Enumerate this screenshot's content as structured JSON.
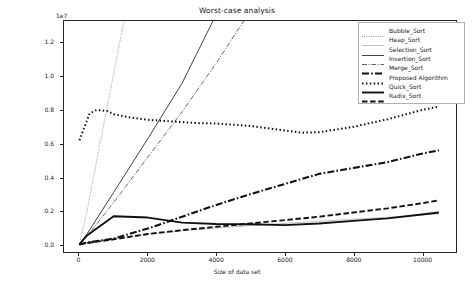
{
  "chart_data": {
    "type": "line",
    "title": "Worst-case analysis",
    "xlabel": "Size of data set",
    "ylabel": "Execution time in nano seconds",
    "y_exponent_label": "1e7",
    "y_scale": 10000000,
    "xlim": [
      -450,
      11000
    ],
    "ylim": [
      -0.045,
      1.33
    ],
    "xticks": [
      0,
      2000,
      4000,
      6000,
      8000,
      10000
    ],
    "xticklabels": [
      "0",
      "2000",
      "4000",
      "6000",
      "8000",
      "10000"
    ],
    "yticks": [
      0.0,
      0.2,
      0.4,
      0.6,
      0.8,
      1.0,
      1.2
    ],
    "yticklabels": [
      "0.0",
      "0.2",
      "0.4",
      "0.6",
      "0.8",
      "1.0",
      "1.2"
    ],
    "grid": false,
    "legend_position": "upper right",
    "series": [
      {
        "name": "Bubble_Sort",
        "style": "dotted-fine",
        "x": [
          0,
          200,
          1300
        ],
        "y": [
          0.0,
          0.18,
          1.33
        ]
      },
      {
        "name": "Heap_Sort",
        "style": "solid-faint",
        "x": [
          0,
          200,
          1000,
          2000,
          3000,
          4000,
          5000,
          6000,
          7000,
          8000,
          9000,
          10000,
          10500
        ],
        "y": [
          0.0,
          0.012,
          0.035,
          0.062,
          0.082,
          0.098,
          0.112,
          0.125,
          0.138,
          0.15,
          0.162,
          0.176,
          0.182
        ]
      },
      {
        "name": "Selection_Sort",
        "style": "solid-thin",
        "x": [
          0,
          200,
          1000,
          2000,
          3000,
          3900
        ],
        "y": [
          0.0,
          0.055,
          0.31,
          0.63,
          0.96,
          1.33
        ]
      },
      {
        "name": "Insertion_Sort",
        "style": "dashdot-thin",
        "x": [
          0,
          200,
          1000,
          2000,
          3000,
          4000,
          4800
        ],
        "y": [
          0.0,
          0.042,
          0.25,
          0.52,
          0.79,
          1.08,
          1.33
        ]
      },
      {
        "name": "Merge_Sort",
        "style": "dashdot-thick",
        "x": [
          0,
          200,
          1000,
          2000,
          3000,
          4000,
          5000,
          6000,
          7000,
          8000,
          9000,
          10000,
          10500
        ],
        "y": [
          0.0,
          0.01,
          0.035,
          0.095,
          0.165,
          0.235,
          0.3,
          0.36,
          0.42,
          0.455,
          0.49,
          0.54,
          0.56
        ]
      },
      {
        "name": "Proposed Algorithm",
        "style": "dotted-thick",
        "x": [
          0,
          150,
          300,
          500,
          800,
          1000,
          1500,
          2000,
          2500,
          3000,
          3500,
          4000,
          5000,
          6000,
          6500,
          7000,
          8000,
          9000,
          10000,
          10500
        ],
        "y": [
          0.62,
          0.7,
          0.78,
          0.8,
          0.795,
          0.775,
          0.755,
          0.742,
          0.735,
          0.728,
          0.722,
          0.72,
          0.705,
          0.678,
          0.665,
          0.668,
          0.7,
          0.745,
          0.8,
          0.82
        ]
      },
      {
        "name": "Quick_Sort",
        "style": "solid-thick",
        "x": [
          0,
          200,
          1000,
          2000,
          3000,
          4000,
          5000,
          6000,
          7000,
          8000,
          9000,
          10000,
          10500
        ],
        "y": [
          0.0,
          0.05,
          0.168,
          0.16,
          0.13,
          0.122,
          0.12,
          0.115,
          0.125,
          0.14,
          0.155,
          0.178,
          0.19
        ]
      },
      {
        "name": "Radix_Sort",
        "style": "dashed-thick",
        "x": [
          0,
          200,
          1000,
          2000,
          3000,
          4000,
          5000,
          6000,
          7000,
          8000,
          9000,
          10000,
          10500
        ],
        "y": [
          0.0,
          0.008,
          0.03,
          0.062,
          0.085,
          0.105,
          0.125,
          0.145,
          0.165,
          0.19,
          0.215,
          0.245,
          0.262
        ]
      }
    ]
  },
  "legend": {
    "entries": [
      {
        "label": "Bubble_Sort"
      },
      {
        "label": "Heap_Sort"
      },
      {
        "label": "Selection_Sort"
      },
      {
        "label": "Insertion_Sort"
      },
      {
        "label": "Merge_Sort"
      },
      {
        "label": "Proposed Algorithm"
      },
      {
        "label": "Quick_Sort"
      },
      {
        "label": "Radix_Sort"
      }
    ]
  },
  "colors": {
    "axis": "#262626",
    "line": "#1a1a1a",
    "faint": "#9a9a9a",
    "background": "#ffffff"
  }
}
